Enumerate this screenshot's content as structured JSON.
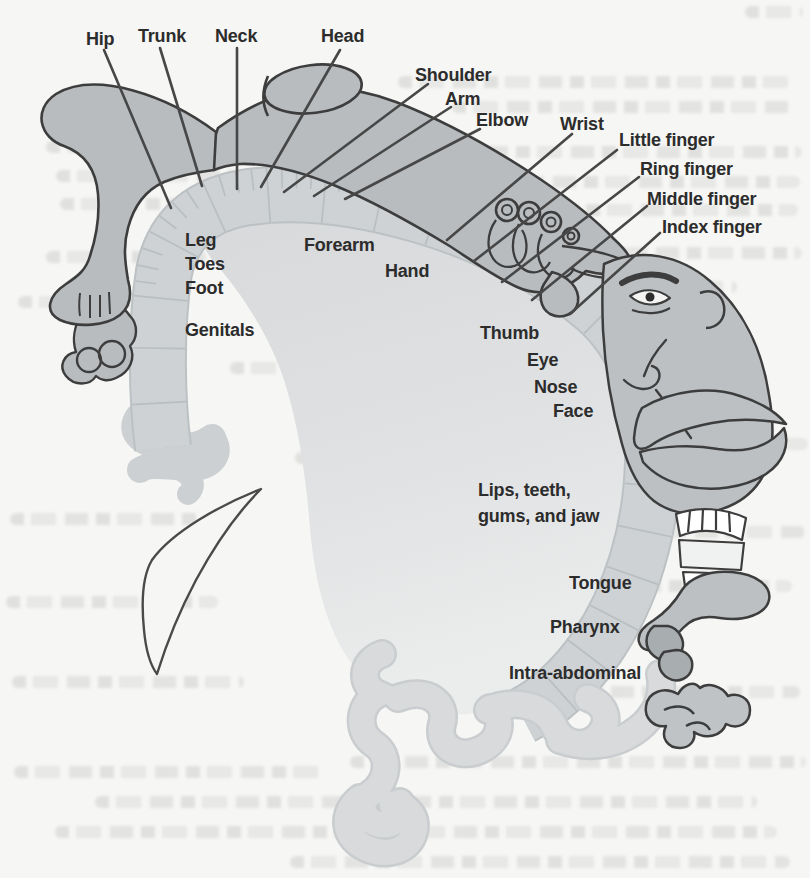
{
  "callout_labels": {
    "hip": "Hip",
    "trunk": "Trunk",
    "neck": "Neck",
    "head": "Head",
    "shoulder": "Shoulder",
    "arm": "Arm",
    "elbow": "Elbow",
    "wrist": "Wrist",
    "little_finger": "Little finger",
    "ring_finger": "Ring finger",
    "middle_finger": "Middle finger",
    "index_finger": "Index finger"
  },
  "region_labels": {
    "leg": "Leg",
    "toes": "Toes",
    "foot": "Foot",
    "genitals": "Genitals",
    "forearm": "Forearm",
    "hand": "Hand",
    "thumb": "Thumb",
    "eye": "Eye",
    "nose": "Nose",
    "face": "Face",
    "lips_line1": "Lips, teeth,",
    "lips_line2": "gums, and jaw",
    "tongue": "Tongue",
    "pharynx": "Pharynx",
    "intra_abdominal": "Intra-abdominal"
  },
  "colors": {
    "background": "#f6f6f4",
    "body_fill": "#b8bcbf",
    "cortex_band": "#ced2d4",
    "band_edge": "#bcc1c4",
    "inner_fill_top": "#d7d9db",
    "inner_fill_bottom": "#eaebeb",
    "dark_outline": "#3d3d3d",
    "label_text": "#2c2c2c",
    "deep_structure": "#a8adb0",
    "teeth_fill": "#ffffff"
  }
}
